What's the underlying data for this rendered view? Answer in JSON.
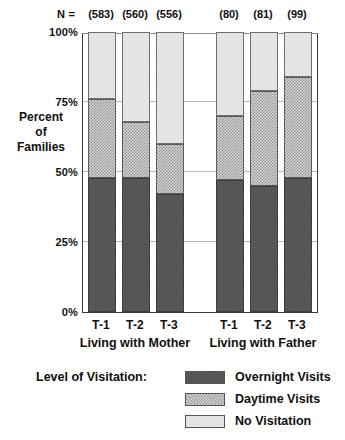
{
  "chart_data": {
    "type": "bar",
    "subtype": "stacked-percent",
    "title": "",
    "xlabel": "",
    "ylabel": "Percent of Families",
    "ylim": [
      0,
      100
    ],
    "yticks": [
      "0%",
      "25%",
      "50%",
      "75%",
      "100%"
    ],
    "ytick_values": [
      0,
      25,
      50,
      75,
      100
    ],
    "grid": true,
    "legend_position": "bottom",
    "legend_title": "Level of Visitation:",
    "categories": [
      "T-1",
      "T-2",
      "T-3",
      "T-1",
      "T-2",
      "T-3"
    ],
    "groups": [
      {
        "label": "Living with Mother",
        "categories": [
          "T-1",
          "T-2",
          "T-3"
        ]
      },
      {
        "label": "Living with Father",
        "categories": [
          "T-1",
          "T-2",
          "T-3"
        ]
      }
    ],
    "n_label": "N =",
    "n_values": [
      "(583)",
      "(560)",
      "(556)",
      "(80)",
      "(81)",
      "(99)"
    ],
    "series": [
      {
        "name": "Overnight Visits",
        "color": "#5e5e5e",
        "values": [
          48,
          48,
          42,
          47,
          45,
          48
        ]
      },
      {
        "name": "Daytime Visits",
        "color": "#a8a8a8",
        "values": [
          28,
          20,
          18,
          23,
          34,
          36
        ]
      },
      {
        "name": "No Visitation",
        "color": "#e8e8e8",
        "values": [
          24,
          32,
          40,
          30,
          21,
          16
        ]
      }
    ]
  },
  "axis": {
    "y_label_lines": [
      "Percent",
      "of",
      "Families"
    ]
  },
  "legend": {
    "title": "Level of Visitation:",
    "items": [
      {
        "label": "Overnight Visits",
        "swatch": "overnight"
      },
      {
        "label": "Daytime Visits",
        "swatch": "daytime"
      },
      {
        "label": "No Visitation",
        "swatch": "none"
      }
    ]
  }
}
